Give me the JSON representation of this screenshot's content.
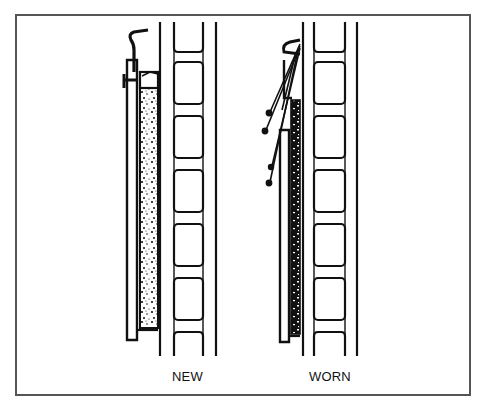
{
  "figure": {
    "type": "technical-illustration",
    "panels": [
      {
        "id": "new",
        "label": "NEW"
      },
      {
        "id": "worn",
        "label": "WORN"
      }
    ],
    "colors": {
      "ink": "#111111",
      "frame": "#555555",
      "background": "#ffffff"
    }
  }
}
